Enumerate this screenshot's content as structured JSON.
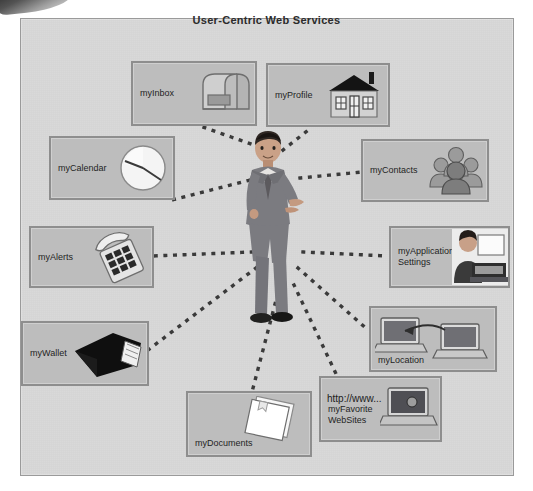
{
  "diagram": {
    "title": "User-Centric Web Services",
    "center": {
      "name": "user-figure",
      "description": "person in suit"
    },
    "nodes": [
      {
        "id": "myinbox",
        "label": "myInbox",
        "icon": "mailbox-icon",
        "x": 131,
        "y": 61,
        "w": 122,
        "h": 61
      },
      {
        "id": "myprofile",
        "label": "myProfile",
        "icon": "house-icon",
        "x": 266,
        "y": 63,
        "w": 120,
        "h": 60
      },
      {
        "id": "mycalendar",
        "label": "myCalendar",
        "icon": "clock-icon",
        "x": 49,
        "y": 136,
        "w": 122,
        "h": 60
      },
      {
        "id": "mycontacts",
        "label": "myContacts",
        "icon": "people-group-icon",
        "x": 361,
        "y": 139,
        "w": 124,
        "h": 59
      },
      {
        "id": "myalerts",
        "label": "myAlerts",
        "icon": "telephone-icon",
        "x": 29,
        "y": 226,
        "w": 121,
        "h": 58
      },
      {
        "id": "myappsettings",
        "label": "myApplication\nSettings",
        "icon": "person-at-computer-icon",
        "x": 389,
        "y": 226,
        "w": 117,
        "h": 58
      },
      {
        "id": "mylocation",
        "label": "myLocation",
        "icon": "two-laptops-icon",
        "x": 369,
        "y": 306,
        "w": 124,
        "h": 62
      },
      {
        "id": "mywallet",
        "label": "myWallet",
        "icon": "wallet-icon",
        "x": 21,
        "y": 321,
        "w": 124,
        "h": 61
      },
      {
        "id": "myfavorites",
        "label": "myFavorite\nWebSites",
        "icon": "laptop-browser-icon",
        "x": 319,
        "y": 376,
        "w": 119,
        "h": 62,
        "http_text": "http://www..."
      },
      {
        "id": "mydocuments",
        "label": "myDocuments",
        "icon": "documents-icon",
        "x": 186,
        "y": 391,
        "w": 122,
        "h": 62
      }
    ],
    "connector": {
      "style": "dotted",
      "color": "#3a3a3a"
    },
    "colors": {
      "canvas_background": "#d9d9d9",
      "node_fill": "#bdbdbd",
      "node_border": "#8e8e8e",
      "title_text": "#2b2b2b",
      "label_text": "#1f1f1f"
    }
  }
}
